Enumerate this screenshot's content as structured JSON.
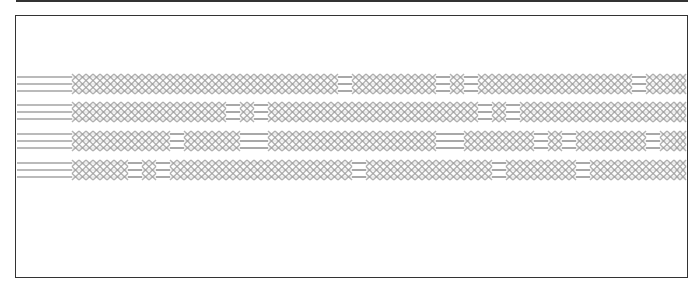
{
  "diagram": {
    "type": "timing-waveform",
    "frame": {
      "x": 15,
      "y": 15,
      "width": 673,
      "height": 262
    },
    "colors": {
      "border": "#333333",
      "wave": "#9a9a9a",
      "background": "#ffffff"
    },
    "lead_in": {
      "x_start": 17,
      "x_end": 72
    },
    "pattern_end_x": 686,
    "cell_width": 14,
    "bands": [
      {
        "name": "bus-1",
        "y_center": 84,
        "bus_segments": [
          [
            330,
            345
          ],
          [
            430,
            445
          ],
          [
            455,
            470
          ],
          [
            625,
            645
          ]
        ]
      },
      {
        "name": "bus-2",
        "y_center": 112,
        "bus_segments": [
          [
            222,
            235
          ],
          [
            245,
            258
          ],
          [
            465,
            480
          ],
          [
            500,
            515
          ]
        ]
      },
      {
        "name": "bus-3",
        "y_center": 141,
        "bus_segments": [
          [
            160,
            178
          ],
          [
            240,
            255
          ],
          [
            435,
            455
          ],
          [
            525,
            540
          ],
          [
            555,
            570
          ],
          [
            640,
            655
          ]
        ]
      },
      {
        "name": "bus-4",
        "y_center": 170,
        "bus_segments": [
          [
            123,
            135
          ],
          [
            145,
            160
          ],
          [
            350,
            360
          ],
          [
            485,
            505
          ],
          [
            570,
            590
          ]
        ]
      }
    ]
  }
}
